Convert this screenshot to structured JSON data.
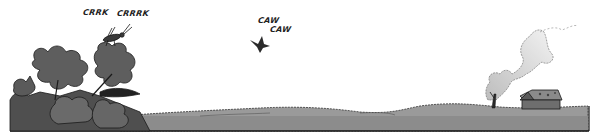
{
  "panel": {
    "description": "Comic panel: rural landscape with flowers, cricket, crow and a smoking cabin",
    "colors": {
      "sky": "#ffffff",
      "ground": "#8c8c8c",
      "hills": "#9a9a9a",
      "flowers": "#5a5a5a",
      "outline": "#1a1a1a",
      "smoke": "#d8d8d8",
      "cabin": "#6e6e6e"
    }
  },
  "sound_effects": {
    "cricket_1": "CRRK",
    "cricket_2": "CRRRK",
    "crow_1": "CAW",
    "crow_2": "CAW"
  },
  "icons": {
    "flowers": "flower-cluster-icon",
    "cricket": "cricket-icon",
    "crow": "crow-icon",
    "cabin": "cabin-icon",
    "smoke": "smoke-plume-icon",
    "tree": "bare-tree-icon"
  }
}
